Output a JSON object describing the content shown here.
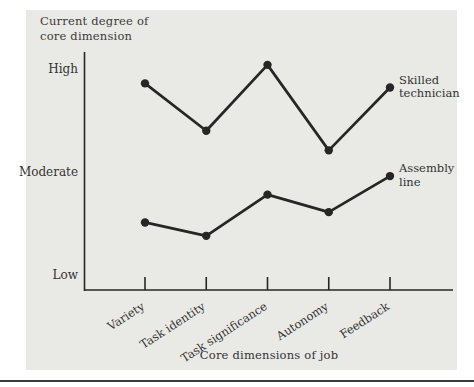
{
  "figure": {
    "background_color": "#ffffff",
    "panel_color": "#e9eae6",
    "rule_color": "#3c3c3c",
    "text_color": "#333333",
    "line_color": "#262626"
  },
  "chart_data": {
    "type": "line",
    "title": "",
    "ylabel": "Current degree of core dimension",
    "ylabel_lines": [
      "Current degree of",
      "core dimension"
    ],
    "xlabel": "Core dimensions of job",
    "categories": [
      "Variety",
      "Task identity",
      "Task significance",
      "Autonomy",
      "Feedback"
    ],
    "y_axis_type": "qualitative",
    "y_ticks": [
      {
        "label": "High",
        "value": 2
      },
      {
        "label": "Moderate",
        "value": 1
      },
      {
        "label": "Low",
        "value": 0
      }
    ],
    "ylim": [
      0,
      2.3
    ],
    "grid": false,
    "marker": "filled-circle",
    "legend_position": "right-end-of-line",
    "series": [
      {
        "name": "Skilled technician",
        "label_lines": [
          "Skilled",
          "technician"
        ],
        "values": [
          1.87,
          1.41,
          2.05,
          1.22,
          1.83
        ]
      },
      {
        "name": "Assembly line",
        "label_lines": [
          "Assembly",
          "line"
        ],
        "values": [
          0.52,
          0.39,
          0.79,
          0.62,
          0.97
        ]
      }
    ]
  }
}
